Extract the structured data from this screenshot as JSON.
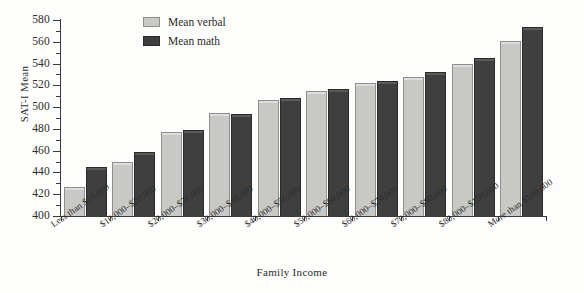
{
  "chart_data": {
    "type": "bar",
    "title": "",
    "xlabel": "Family Income",
    "ylabel": "SAT-I Mean",
    "ylim": [
      400,
      580
    ],
    "ytick_step": 20,
    "yminor_step": 10,
    "grid": false,
    "legend_position": "top-center",
    "categories": [
      "Less than $10,000",
      "$10,000–$20,000",
      "$20,000–$30,000",
      "$30,000–$40,000",
      "$40,000–$50,000",
      "$50,000–$60,000",
      "$60,000–$70,000",
      "$70,000–$80,000",
      "$80,000–$100,000",
      "More than $100,000"
    ],
    "ytick_labels": [
      "400",
      "420",
      "440",
      "460",
      "480",
      "500",
      "520",
      "540",
      "560",
      "580"
    ],
    "series": [
      {
        "name": "Mean verbal",
        "color": "#c8c8c6",
        "values": [
          427,
          450,
          477,
          495,
          507,
          515,
          522,
          528,
          540,
          561
        ]
      },
      {
        "name": "Mean math",
        "color": "#3f3f3f",
        "values": [
          445,
          459,
          479,
          494,
          508,
          517,
          524,
          532,
          545,
          574
        ]
      }
    ]
  },
  "legend": {
    "items": [
      {
        "label": "Mean verbal",
        "color": "#c8c8c6"
      },
      {
        "label": "Mean math",
        "color": "#3f3f3f"
      }
    ]
  },
  "axes": {
    "y_title": "SAT-I Mean",
    "x_title": "Family Income"
  }
}
